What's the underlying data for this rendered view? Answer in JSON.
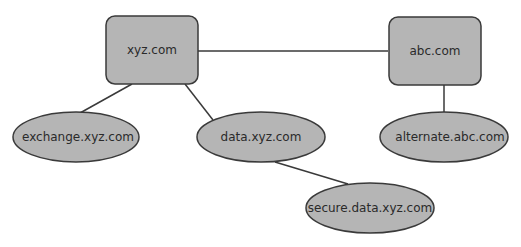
{
  "diagram": {
    "colors": {
      "node_fill": "#b5b5b5",
      "stroke": "#3a3a3a",
      "text": "#2a2a2a",
      "background": "#ffffff"
    },
    "nodes": [
      {
        "id": "xyz",
        "label": "xyz.com",
        "shape": "rounded-rect"
      },
      {
        "id": "abc",
        "label": "abc.com",
        "shape": "rounded-rect"
      },
      {
        "id": "exchange",
        "label": "exchange.xyz.com",
        "shape": "ellipse"
      },
      {
        "id": "data",
        "label": "data.xyz.com",
        "shape": "ellipse"
      },
      {
        "id": "alternate",
        "label": "alternate.abc.com",
        "shape": "ellipse"
      },
      {
        "id": "secure",
        "label": "secure.data.xyz.com",
        "shape": "ellipse"
      }
    ],
    "edges": [
      {
        "from": "xyz",
        "to": "abc"
      },
      {
        "from": "xyz",
        "to": "exchange"
      },
      {
        "from": "xyz",
        "to": "data"
      },
      {
        "from": "abc",
        "to": "alternate"
      },
      {
        "from": "data",
        "to": "secure"
      }
    ]
  }
}
